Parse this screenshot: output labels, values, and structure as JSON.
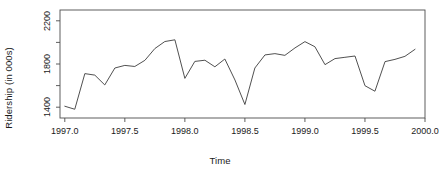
{
  "chart_data": {
    "type": "line",
    "title": "",
    "xlabel": "Time",
    "ylabel": "Ridership (in 000s)",
    "xlim": [
      1996.96,
      2000.0
    ],
    "ylim": [
      1300,
      2300
    ],
    "grid": false,
    "legend": false,
    "line_color": "#3c3c3c",
    "frame_color": "#4d4d4d",
    "x_ticks": [
      1997.0,
      1997.5,
      1998.0,
      1998.5,
      1999.0,
      1999.5,
      2000.0
    ],
    "x_tick_labels": [
      "1997.0",
      "1997.5",
      "1998.0",
      "1998.5",
      "1999.0",
      "1999.5",
      "2000.0"
    ],
    "y_ticks": [
      1400,
      1600,
      1800,
      2000,
      2200
    ],
    "y_tick_labels": [
      "1400",
      "",
      "1800",
      "",
      "2200"
    ],
    "y_labeled_ticks": [
      1400,
      1800,
      2200
    ],
    "x": [
      1997.0,
      1997.083,
      1997.167,
      1997.25,
      1997.333,
      1997.417,
      1997.5,
      1997.583,
      1997.667,
      1997.75,
      1997.833,
      1997.917,
      1998.0,
      1998.083,
      1998.167,
      1998.25,
      1998.333,
      1998.417,
      1998.5,
      1998.583,
      1998.667,
      1998.75,
      1998.833,
      1998.917,
      1999.0,
      1999.083,
      1999.167,
      1999.25,
      1999.333,
      1999.417,
      1999.5,
      1999.583,
      1999.667,
      1999.75,
      1999.833,
      1999.917
    ],
    "values": [
      1409,
      1381,
      1711,
      1697,
      1606,
      1763,
      1787,
      1777,
      1834,
      1943,
      2008,
      2024,
      1667,
      1824,
      1835,
      1774,
      1846,
      1652,
      1425,
      1763,
      1884,
      1896,
      1880,
      1949,
      2007,
      1960,
      1794,
      1850,
      1862,
      1874,
      1599,
      1548,
      1822,
      1843,
      1871,
      1936
    ],
    "series_name": "Ridership"
  },
  "axes": {
    "y_title": "Ridership (in 000s)",
    "x_title": "Time"
  }
}
